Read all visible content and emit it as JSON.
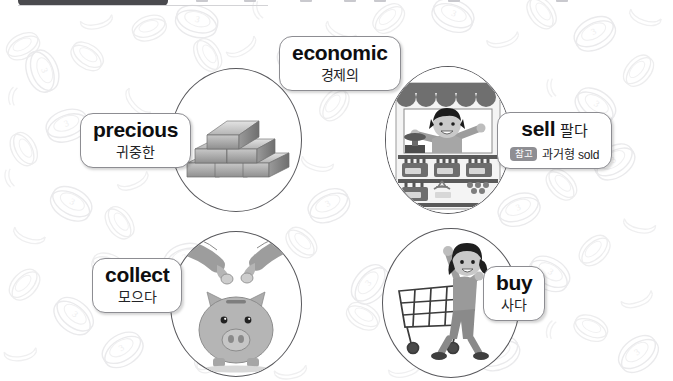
{
  "slide": {
    "theme": "money-vocabulary",
    "background_pattern": "coins",
    "background_color": "#ffffff"
  },
  "toolbar": {
    "visible": "partial",
    "icon_names": [
      "tab-handle",
      "toolbar-icon",
      "toolbar-icon",
      "toolbar-icon",
      "toolbar-icon",
      "toolbar-icon",
      "toolbar-icon"
    ]
  },
  "cards": [
    {
      "id": "economic",
      "word": "economic",
      "translation": "경제의",
      "icon_name": "economic-label-card"
    },
    {
      "id": "precious",
      "word": "precious",
      "translation": "귀중한",
      "icon_name": "precious-label-card"
    },
    {
      "id": "sell",
      "word": "sell",
      "translation": "팔다",
      "badge": "참고",
      "note": "과거형 sold",
      "icon_name": "sell-label-card"
    },
    {
      "id": "collect",
      "word": "collect",
      "translation": "모으다",
      "icon_name": "collect-label-card"
    },
    {
      "id": "buy",
      "word": "buy",
      "translation": "사다",
      "icon_name": "buy-label-card"
    }
  ],
  "illustrations": [
    {
      "id": "precious",
      "icon_name": "gold-bars-icon",
      "alt": "stack of gold bars"
    },
    {
      "id": "sell",
      "icon_name": "shop-stall-icon",
      "alt": "boy shopkeeper at market stall with shelves"
    },
    {
      "id": "collect",
      "icon_name": "piggy-bank-icon",
      "alt": "hands dropping coins into a piggy bank"
    },
    {
      "id": "buy",
      "icon_name": "shopping-cart-girl-icon",
      "alt": "girl pushing a shopping cart"
    }
  ],
  "colors": {
    "card_border": "#8d8d92",
    "circle_stroke": "#58585c",
    "badge_bg": "#8e8e93",
    "text": "#0e0e10",
    "coin_outline": "#ececed"
  }
}
